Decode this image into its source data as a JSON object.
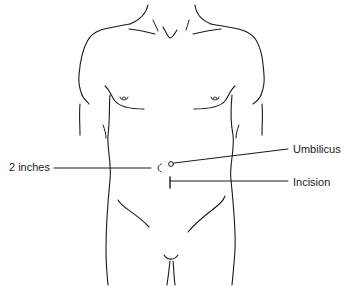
{
  "diagram": {
    "labels": {
      "distance": "2 inches",
      "umbilicus": "Umbilicus",
      "incision": "Incision"
    },
    "colors": {
      "line": "#1a1a1a",
      "background": "#ffffff"
    }
  }
}
